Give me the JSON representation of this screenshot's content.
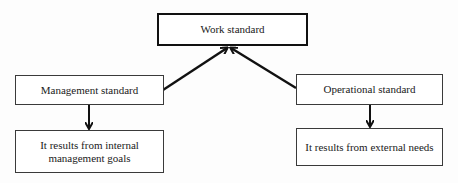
{
  "diagram": {
    "type": "hierarchy",
    "nodes": {
      "work_standard": {
        "label": "Work standard"
      },
      "management_standard": {
        "label": "Management standard"
      },
      "operational_standard": {
        "label": "Operational standard"
      },
      "internal_goals": {
        "label": "It results from internal management goals",
        "line1": "It results from internal",
        "line2": "management goals"
      },
      "external_needs": {
        "label": "It results from external needs"
      }
    },
    "edges": [
      {
        "from": "management_standard",
        "to": "work_standard"
      },
      {
        "from": "operational_standard",
        "to": "work_standard"
      },
      {
        "from": "management_standard",
        "to": "internal_goals"
      },
      {
        "from": "operational_standard",
        "to": "external_needs"
      }
    ],
    "colors": {
      "line": "#111111",
      "border": "#3a3a3a",
      "background": "#ffffff"
    }
  }
}
